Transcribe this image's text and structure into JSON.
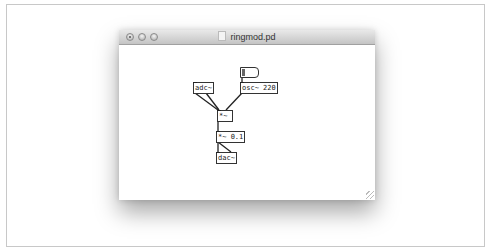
{
  "window": {
    "title": "ringmod.pd",
    "buttons": {
      "close": "close",
      "minimize": "minimize",
      "zoom": "zoom"
    }
  },
  "patch": {
    "objects": [
      {
        "id": "adc",
        "label": "adc~",
        "x": 74,
        "y": 37
      },
      {
        "id": "osc",
        "label": "osc~ 220",
        "x": 121,
        "y": 37
      },
      {
        "id": "mul",
        "label": "*~",
        "x": 98,
        "y": 65
      },
      {
        "id": "gain",
        "label": "*~ 0.1",
        "x": 97,
        "y": 86
      },
      {
        "id": "dac",
        "label": "dac~",
        "x": 97,
        "y": 107
      }
    ],
    "message": {
      "x": 121,
      "y": 22,
      "label": ""
    },
    "connections": [
      [
        "adc.0",
        "mul.0"
      ],
      [
        "adc.1",
        "mul.0"
      ],
      [
        "osc.0",
        "mul.1"
      ],
      [
        "msg.0",
        "osc.0"
      ],
      [
        "mul.0",
        "gain.0"
      ],
      [
        "gain.0",
        "dac.0"
      ],
      [
        "gain.0",
        "dac.1"
      ]
    ]
  }
}
